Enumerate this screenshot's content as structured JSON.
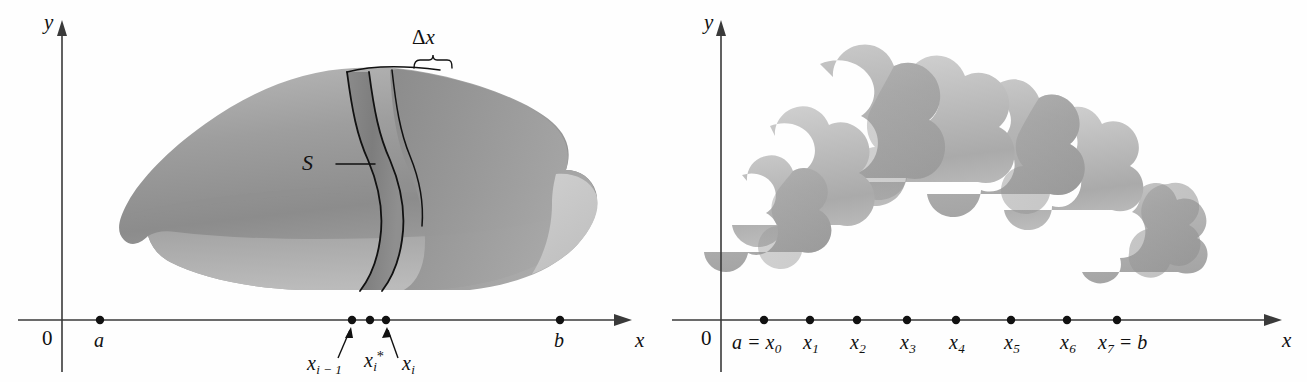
{
  "figure": {
    "type": "math-diagram",
    "background_color": "#fefefe",
    "ink_color": "#111111",
    "solid_fill_color": "#9a9a9a",
    "cylinder_fill_color": "#b4b4b4"
  },
  "left_panel": {
    "name": "solid-with-slice",
    "y_axis_label": "y",
    "x_axis_label": "x",
    "origin_label": "0",
    "solid_label": "S",
    "slice_width_label": "Δx",
    "delta_symbol": "Δ",
    "delta_var": "x",
    "tick_labels": [
      {
        "id": "a",
        "base": "a",
        "sub": "",
        "x": 100
      },
      {
        "id": "x_im1",
        "base": "x",
        "sub": "i − 1",
        "x": 352
      },
      {
        "id": "x_star",
        "base": "x",
        "sub": "i",
        "sup": "*",
        "x": 370
      },
      {
        "id": "x_i",
        "base": "x",
        "sub": "i",
        "x": 386
      },
      {
        "id": "b",
        "base": "b",
        "sub": "",
        "x": 560
      }
    ],
    "dots_x": [
      100,
      352,
      370,
      386,
      560
    ],
    "axis_y": 320
  },
  "right_panel": {
    "name": "cylinder-approximation",
    "y_axis_label": "y",
    "x_axis_label": "x",
    "origin_label": "0",
    "cylinder_count": 7,
    "tick_labels": [
      {
        "id": "x0",
        "text_a": "a = ",
        "base": "x",
        "sub": "0",
        "x": 764
      },
      {
        "id": "x1",
        "text_a": "",
        "base": "x",
        "sub": "1",
        "x": 810
      },
      {
        "id": "x2",
        "text_a": "",
        "base": "x",
        "sub": "2",
        "x": 857
      },
      {
        "id": "x3",
        "text_a": "",
        "base": "x",
        "sub": "3",
        "x": 907
      },
      {
        "id": "x4",
        "text_a": "",
        "base": "x",
        "sub": "4",
        "x": 956
      },
      {
        "id": "x5",
        "text_a": "",
        "base": "x",
        "sub": "5",
        "x": 1011
      },
      {
        "id": "x6",
        "text_a": "",
        "base": "x",
        "sub": "6",
        "x": 1067
      },
      {
        "id": "x7",
        "text_a": "",
        "base": "x",
        "sub": "7",
        "text_b": " = b",
        "x": 1117
      }
    ],
    "dots_x": [
      764,
      810,
      857,
      907,
      956,
      1011,
      1067,
      1117
    ],
    "axis_y": 320
  }
}
